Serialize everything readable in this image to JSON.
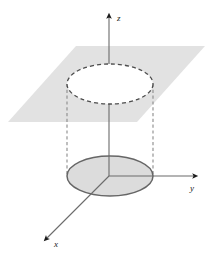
{
  "figure": {
    "background_color": "#ffffff",
    "width": 213,
    "height": 255
  },
  "axes": {
    "origin": {
      "x": 109,
      "y": 176
    },
    "color": "#6b6b6b",
    "arrow_color": "#1a1a1a",
    "z": {
      "label": "z",
      "label_x": 117,
      "label_y": 21,
      "from": {
        "x": 109,
        "y": 176
      },
      "to": {
        "x": 109,
        "y": 14
      },
      "arrow": "up"
    },
    "y": {
      "label": "y",
      "label_x": 190,
      "label_y": 191,
      "from": {
        "x": 109,
        "y": 176
      },
      "to": {
        "x": 197,
        "y": 176
      },
      "arrow": "right"
    },
    "x": {
      "label": "x",
      "label_x": 54,
      "label_y": 247,
      "from": {
        "x": 109,
        "y": 176
      },
      "to": {
        "x": 44,
        "y": 241
      },
      "arrow": "down-left"
    }
  },
  "plane": {
    "name": "horizontal-cutting-plane",
    "fill_color": "#e2e2e2",
    "points": "76,46 205,46 137,122 8,122"
  },
  "cylinder": {
    "top_ellipse": {
      "name": "cylinder-top-rim",
      "style": "dashed",
      "fill": "none",
      "stroke_color": "#4d4d4d",
      "cx": 110,
      "cy": 84,
      "rx": 43,
      "ry": 20
    },
    "bottom_ellipse": {
      "name": "cylinder-base-disk",
      "style": "solid",
      "fill_color": "#dcdcdc",
      "stroke_color": "#666666",
      "cx": 110,
      "cy": 176,
      "rx": 43,
      "ry": 20
    },
    "side_lines": [
      {
        "name": "cylinder-side-left",
        "x": 67,
        "y1": 84,
        "y2": 176,
        "style": "dashed"
      },
      {
        "name": "cylinder-side-right",
        "x": 153,
        "y1": 84,
        "y2": 176,
        "style": "dashed"
      }
    ],
    "side_stroke_color": "#8a8a8a"
  }
}
